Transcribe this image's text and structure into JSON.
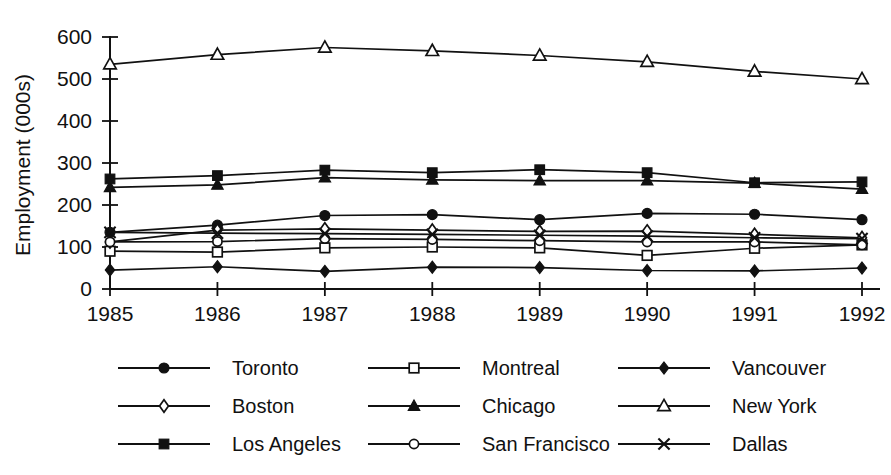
{
  "chart_data": {
    "type": "line",
    "title": "",
    "xlabel": "",
    "ylabel": "Employment (000s)",
    "x": [
      1985,
      1986,
      1987,
      1988,
      1989,
      1990,
      1991,
      1992
    ],
    "xtick_labels": [
      "1985",
      "1986",
      "1987",
      "1988",
      "1989",
      "1990",
      "1991",
      "1992"
    ],
    "ytick_labels": [
      "0",
      "100",
      "200",
      "300",
      "400",
      "500",
      "600"
    ],
    "yticks": [
      0,
      100,
      200,
      300,
      400,
      500,
      600
    ],
    "ylim": [
      0,
      600
    ],
    "xlim": [
      1985,
      1992
    ],
    "grid": false,
    "legend_position": "bottom",
    "legend_columns": 3,
    "series": [
      {
        "name": "Toronto",
        "marker": "filled-circle",
        "values": [
          135,
          152,
          175,
          177,
          165,
          180,
          178,
          165
        ]
      },
      {
        "name": "Montreal",
        "marker": "open-square",
        "values": [
          90,
          88,
          98,
          100,
          98,
          80,
          97,
          105
        ]
      },
      {
        "name": "Vancouver",
        "marker": "filled-diamond",
        "values": [
          45,
          53,
          42,
          52,
          51,
          44,
          43,
          50
        ]
      },
      {
        "name": "Boston",
        "marker": "open-diamond",
        "values": [
          112,
          140,
          143,
          140,
          137,
          138,
          130,
          122
        ]
      },
      {
        "name": "Chicago",
        "marker": "filled-triangle",
        "values": [
          242,
          248,
          265,
          260,
          258,
          258,
          252,
          238
        ]
      },
      {
        "name": "New York",
        "marker": "open-triangle",
        "values": [
          535,
          558,
          575,
          567,
          556,
          541,
          518,
          500
        ]
      },
      {
        "name": "Los Angeles",
        "marker": "filled-square",
        "values": [
          262,
          270,
          283,
          277,
          284,
          277,
          253,
          255
        ]
      },
      {
        "name": "San Francisco",
        "marker": "open-circle",
        "values": [
          112,
          113,
          120,
          118,
          115,
          112,
          112,
          105
        ]
      },
      {
        "name": "Dallas",
        "marker": "cross",
        "values": [
          135,
          133,
          132,
          130,
          128,
          126,
          122,
          120
        ]
      }
    ]
  },
  "axis": {
    "y_title": "Employment (000s)"
  },
  "colors": {
    "foreground": "#111111",
    "background": "#ffffff"
  }
}
